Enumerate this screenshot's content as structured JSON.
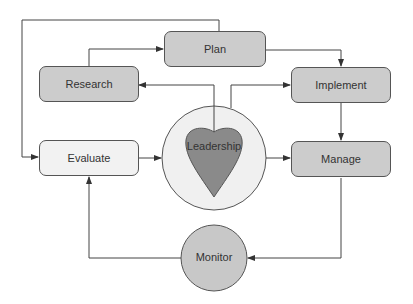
{
  "diagram": {
    "nodes": {
      "plan": "Plan",
      "research": "Research",
      "implement": "Implement",
      "evaluate": "Evaluate",
      "manage": "Manage",
      "leadership": "Leadership",
      "monitor": "Monitor"
    },
    "edges": [
      {
        "from": "Research",
        "to": "Plan"
      },
      {
        "from": "Plan",
        "to": "Implement"
      },
      {
        "from": "Leadership",
        "to": "Research"
      },
      {
        "from": "Leadership",
        "to": "Implement"
      },
      {
        "from": "Implement",
        "to": "Manage"
      },
      {
        "from": "Leadership",
        "to": "Manage"
      },
      {
        "from": "Evaluate",
        "to": "Leadership"
      },
      {
        "from": "Manage",
        "to": "Monitor"
      },
      {
        "from": "Monitor",
        "to": "Evaluate"
      },
      {
        "from": "Plan",
        "to": "Evaluate"
      }
    ],
    "colors": {
      "dark_box": "#cccccc",
      "light_box": "#f2f2f2",
      "heart": "#8a8a8a",
      "outer_circle": "#f0f0f0",
      "monitor": "#c8c8c8",
      "line": "#444444"
    }
  }
}
